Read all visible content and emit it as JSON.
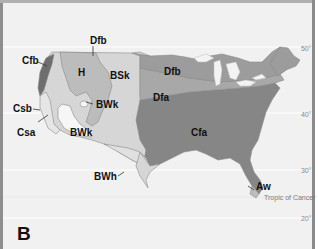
{
  "map": {
    "panel_label": "B",
    "subject": "Climate regions of the contiguous United States",
    "colors": {
      "background": "#f1f1f1",
      "ocean_lines": "#ffffff",
      "Cfb": "#6e6e6e",
      "H": "#bcbcbc",
      "BSk": "#d6d6d6",
      "BWk": "#f6f6f6",
      "Dfb": "#9c9c9c",
      "Dfa": "#a8a8a8",
      "Cfa": "#868686",
      "Csb_Csa": "#e2e2e2",
      "BWh": "#e0e0e0",
      "Aw": "#bdbdbd",
      "border_line": "#555555"
    },
    "climate_labels": [
      {
        "code": "Dfb",
        "position": "north-central top callout"
      },
      {
        "code": "Cfb",
        "position": "pacific northwest coast"
      },
      {
        "code": "H",
        "position": "rocky mountains / highlands"
      },
      {
        "code": "BSk",
        "position": "great plains"
      },
      {
        "code": "Dfb",
        "position": "upper midwest"
      },
      {
        "code": "Csb",
        "position": "northern california coast"
      },
      {
        "code": "BWk",
        "position": "great basin (small)"
      },
      {
        "code": "Dfa",
        "position": "midwest"
      },
      {
        "code": "Csa",
        "position": "central california"
      },
      {
        "code": "BWk",
        "position": "southwest desert"
      },
      {
        "code": "Cfa",
        "position": "southeast"
      },
      {
        "code": "BWh",
        "position": "texas/mexico border"
      },
      {
        "code": "Aw",
        "position": "south florida"
      }
    ],
    "latitude_labels": [
      "50°",
      "40°",
      "30°",
      "20°"
    ],
    "tropic_label": "Tropic of Cancer"
  }
}
